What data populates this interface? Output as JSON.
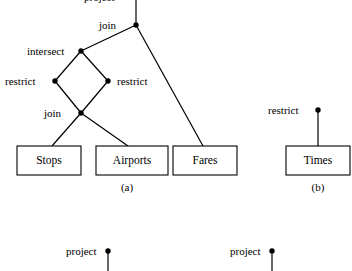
{
  "figure": {
    "background_color": "#ffffff",
    "stroke_color": "#000000",
    "node_color": "#000000",
    "diagram_a": {
      "caption": "(a)",
      "operators": [
        {
          "id": "join-top",
          "label": "join",
          "node_x": 136,
          "node_y": 25,
          "label_x": 99,
          "label_y": 20
        },
        {
          "id": "intersect",
          "label": "intersect",
          "node_x": 81,
          "node_y": 51,
          "label_x": 27,
          "label_y": 46
        },
        {
          "id": "restrict-left",
          "label": "restrict",
          "node_x": 55,
          "node_y": 81,
          "label_x": 5,
          "label_y": 76
        },
        {
          "id": "restrict-right",
          "label": "restrict",
          "node_x": 108,
          "node_y": 81,
          "label_x": 117,
          "label_y": 76
        },
        {
          "id": "join-lower",
          "label": "join",
          "node_x": 81,
          "node_y": 113,
          "label_x": 44,
          "label_y": 108
        }
      ],
      "relations": [
        {
          "id": "stops",
          "label": "Stops",
          "x": 17,
          "y": 146,
          "width": 64,
          "height": 29
        },
        {
          "id": "airports",
          "label": "Airports",
          "x": 96,
          "y": 146,
          "width": 72,
          "height": 29
        },
        {
          "id": "fares",
          "label": "Fares",
          "x": 173,
          "y": 146,
          "width": 64,
          "height": 29
        }
      ],
      "caption_x": 127,
      "caption_y": 182
    },
    "diagram_b": {
      "caption": "(b)",
      "operators": [
        {
          "id": "restrict-times",
          "label": "restrict",
          "node_x": 318,
          "node_y": 110,
          "label_x": 268,
          "label_y": 105
        }
      ],
      "relations": [
        {
          "id": "times",
          "label": "Times",
          "x": 286,
          "y": 146,
          "width": 64,
          "height": 29
        }
      ],
      "caption_x": 318,
      "caption_y": 182
    },
    "bottom_fragments": [
      {
        "id": "project-left",
        "label": "project",
        "node_x": 108,
        "node_y": 251,
        "label_x": 66,
        "label_y": 246,
        "stem_to_y": 271
      },
      {
        "id": "project-right",
        "label": "project",
        "node_x": 272,
        "node_y": 251,
        "label_x": 230,
        "label_y": 246,
        "stem_to_y": 271
      }
    ],
    "top_clipped_fragment": {
      "label": "project",
      "x": 84,
      "y": -8
    }
  }
}
